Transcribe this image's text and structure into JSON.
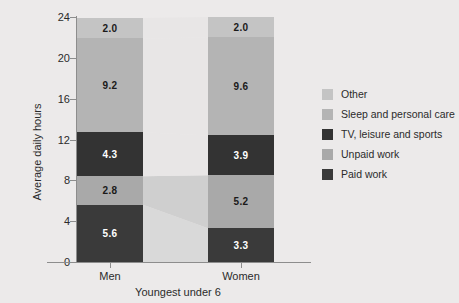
{
  "chart_data": {
    "type": "bar",
    "stacked": true,
    "title": "",
    "xlabel": "Youngest under 6",
    "ylabel": "Average daily hours",
    "categories": [
      "Men",
      "Women"
    ],
    "ylim": [
      0,
      24
    ],
    "yticks": [
      0,
      4,
      8,
      12,
      16,
      20,
      24
    ],
    "ytick_labels": [
      "0",
      "4",
      "8",
      "12",
      "16",
      "20",
      "24"
    ],
    "grid": false,
    "legend_position": "right",
    "stack_order_bottom_to_top": [
      "Paid work",
      "Unpaid work",
      "TV, leisure and sports",
      "Sleep and personal care",
      "Other"
    ],
    "series": [
      {
        "name": "Paid work",
        "color": "#3a3a3a",
        "values": [
          5.6,
          3.3
        ],
        "label_color": "#ffffff"
      },
      {
        "name": "Unpaid work",
        "color": "#a9a9a9",
        "values": [
          2.8,
          5.2
        ],
        "label_color": "#1a1a1a"
      },
      {
        "name": "TV, leisure and sports",
        "color": "#333333",
        "values": [
          4.3,
          3.9
        ],
        "label_color": "#ffffff"
      },
      {
        "name": "Sleep and personal care",
        "color": "#b4b4b4",
        "values": [
          9.2,
          9.6
        ],
        "label_color": "#1a1a1a"
      },
      {
        "name": "Other",
        "color": "#c4c4c4",
        "values": [
          2.0,
          2.0
        ],
        "label_color": "#1a1a1a"
      }
    ],
    "totals": [
      23.9,
      24.0
    ],
    "data_labels": {
      "Men": [
        "5.6",
        "2.8",
        "4.3",
        "9.2",
        "2.0"
      ],
      "Women": [
        "3.3",
        "5.2",
        "3.9",
        "9.6",
        "2.0"
      ]
    }
  },
  "axes": {
    "y_title": "Average daily hours",
    "x_title": "Youngest under 6",
    "y_tick_labels": [
      "24",
      "20",
      "16",
      "12",
      "8",
      "4",
      "0"
    ],
    "x_tick_labels": [
      "Men",
      "Women"
    ]
  },
  "legend": {
    "items": [
      {
        "label": "Other",
        "color": "#c4c4c4"
      },
      {
        "label": "Sleep and personal care",
        "color": "#b4b4b4"
      },
      {
        "label": "TV, leisure and sports",
        "color": "#333333"
      },
      {
        "label": "Unpaid work",
        "color": "#a9a9a9"
      },
      {
        "label": "Paid work",
        "color": "#3a3a3a"
      }
    ]
  },
  "colors": {
    "background": "#eceaea",
    "plot_background": "#eeecec",
    "ribbon_fill": "#e6e4e4",
    "axis": "#8d8d8d",
    "text": "#2b2b2b"
  }
}
